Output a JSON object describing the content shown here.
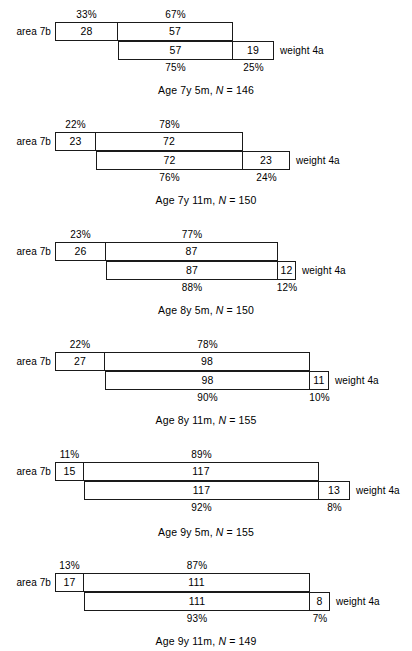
{
  "figure": {
    "labels": {
      "left_row": "area 7b",
      "right_row": "weight 4a"
    }
  },
  "chart_data": {
    "type": "bar",
    "title": "",
    "subtitle": "",
    "xlabel": "",
    "ylabel": "",
    "grid": false,
    "legend_position": "none",
    "orientation": "horizontal",
    "panels": [
      {
        "id": "panel-1",
        "caption_prefix": "Age 7y 5m, ",
        "caption_n_symbol": "N",
        "caption_suffix": " = 146",
        "age": "7y 5m",
        "N": 146,
        "upper_row_label": "area 7b",
        "lower_row_label": "weight 4a",
        "upper": {
          "segments": [
            {
              "name": "area-7b-only",
              "value": 28,
              "percent": "33%",
              "percent_number": 33
            },
            {
              "name": "shared",
              "value": 57,
              "percent": "67%",
              "percent_number": 67
            }
          ]
        },
        "lower": {
          "segments": [
            {
              "name": "shared",
              "value": 57,
              "percent": "75%",
              "percent_number": 75
            },
            {
              "name": "weight-4a-only",
              "value": 19,
              "percent": "25%",
              "percent_number": 25
            }
          ]
        },
        "geometry": {
          "top": 0,
          "height": 108,
          "upper_left": 55,
          "split": 118,
          "upper_right": 233,
          "lower_left": 118,
          "lower_split": 233,
          "lower_right": 274,
          "bar_top": 22,
          "bar_height": 19,
          "caption_top": 84
        }
      },
      {
        "id": "panel-2",
        "caption_prefix": "Age 7y 11m, ",
        "caption_n_symbol": "N",
        "caption_suffix": " = 150",
        "age": "7y 11m",
        "N": 150,
        "upper_row_label": "area 7b",
        "lower_row_label": "weight 4a",
        "upper": {
          "segments": [
            {
              "name": "area-7b-only",
              "value": 23,
              "percent": "22%",
              "percent_number": 22
            },
            {
              "name": "shared",
              "value": 72,
              "percent": "78%",
              "percent_number": 78
            }
          ]
        },
        "lower": {
          "segments": [
            {
              "name": "shared",
              "value": 72,
              "percent": "76%",
              "percent_number": 76
            },
            {
              "name": "weight-4a-only",
              "value": 23,
              "percent": "24%",
              "percent_number": 24
            }
          ]
        },
        "geometry": {
          "top": 110,
          "height": 108,
          "upper_left": 55,
          "split": 96,
          "upper_right": 243,
          "lower_left": 96,
          "lower_split": 243,
          "lower_right": 290,
          "bar_top": 22,
          "bar_height": 19,
          "caption_top": 84
        }
      },
      {
        "id": "panel-3",
        "caption_prefix": "Age 8y 5m, ",
        "caption_n_symbol": "N",
        "caption_suffix": " = 150",
        "age": "8y 5m",
        "N": 150,
        "upper_row_label": "area 7b",
        "lower_row_label": "weight 4a",
        "upper": {
          "segments": [
            {
              "name": "area-7b-only",
              "value": 26,
              "percent": "23%",
              "percent_number": 23
            },
            {
              "name": "shared",
              "value": 87,
              "percent": "77%",
              "percent_number": 77
            }
          ]
        },
        "lower": {
          "segments": [
            {
              "name": "shared",
              "value": 87,
              "percent": "88%",
              "percent_number": 88
            },
            {
              "name": "weight-4a-only",
              "value": 12,
              "percent": "12%",
              "percent_number": 12
            }
          ]
        },
        "geometry": {
          "top": 220,
          "height": 108,
          "upper_left": 55,
          "split": 106,
          "upper_right": 278,
          "lower_left": 106,
          "lower_split": 278,
          "lower_right": 296,
          "bar_top": 22,
          "bar_height": 19,
          "caption_top": 84
        }
      },
      {
        "id": "panel-4",
        "caption_prefix": "Age 8y 11m, ",
        "caption_n_symbol": "N",
        "caption_suffix": " = 155",
        "age": "8y 11m",
        "N": 155,
        "upper_row_label": "area 7b",
        "lower_row_label": "weight 4a",
        "upper": {
          "segments": [
            {
              "name": "area-7b-only",
              "value": 27,
              "percent": "22%",
              "percent_number": 22
            },
            {
              "name": "shared",
              "value": 98,
              "percent": "78%",
              "percent_number": 78
            }
          ]
        },
        "lower": {
          "segments": [
            {
              "name": "shared",
              "value": 98,
              "percent": "90%",
              "percent_number": 90
            },
            {
              "name": "weight-4a-only",
              "value": 11,
              "percent": "10%",
              "percent_number": 10
            }
          ]
        },
        "geometry": {
          "top": 330,
          "height": 108,
          "upper_left": 55,
          "split": 105,
          "upper_right": 310,
          "lower_left": 105,
          "lower_split": 310,
          "lower_right": 329,
          "bar_top": 22,
          "bar_height": 19,
          "caption_top": 84
        }
      },
      {
        "id": "panel-5",
        "caption_prefix": "Age 9y 5m, ",
        "caption_n_symbol": "N",
        "caption_suffix": " = 155",
        "age": "9y 5m",
        "N": 155,
        "upper_row_label": "area 7b",
        "lower_row_label": "weight 4a",
        "upper": {
          "segments": [
            {
              "name": "area-7b-only",
              "value": 15,
              "percent": "11%",
              "percent_number": 11
            },
            {
              "name": "shared",
              "value": 117,
              "percent": "89%",
              "percent_number": 89
            }
          ]
        },
        "lower": {
          "segments": [
            {
              "name": "shared",
              "value": 117,
              "percent": "92%",
              "percent_number": 92
            },
            {
              "name": "weight-4a-only",
              "value": 13,
              "percent": "8%",
              "percent_number": 8
            }
          ]
        },
        "geometry": {
          "top": 440,
          "height": 110,
          "upper_left": 55,
          "split": 84,
          "upper_right": 319,
          "lower_left": 84,
          "lower_split": 319,
          "lower_right": 350,
          "bar_top": 22,
          "bar_height": 19,
          "caption_top": 86
        }
      },
      {
        "id": "panel-6",
        "caption_prefix": "Age 9y 11m, ",
        "caption_n_symbol": "N",
        "caption_suffix": " = 149",
        "age": "9y 11m",
        "N": 149,
        "upper_row_label": "area 7b",
        "lower_row_label": "weight 4a",
        "upper": {
          "segments": [
            {
              "name": "area-7b-only",
              "value": 17,
              "percent": "13%",
              "percent_number": 13
            },
            {
              "name": "shared",
              "value": 111,
              "percent": "87%",
              "percent_number": 87
            }
          ]
        },
        "lower": {
          "segments": [
            {
              "name": "shared",
              "value": 111,
              "percent": "93%",
              "percent_number": 93
            },
            {
              "name": "weight-4a-only",
              "value": 8,
              "percent": "7%",
              "percent_number": 7
            }
          ]
        },
        "geometry": {
          "top": 551,
          "height": 100,
          "upper_left": 55,
          "split": 84,
          "upper_right": 310,
          "lower_left": 84,
          "lower_split": 310,
          "lower_right": 330,
          "bar_top": 22,
          "bar_height": 19,
          "caption_top": 84
        }
      }
    ]
  }
}
